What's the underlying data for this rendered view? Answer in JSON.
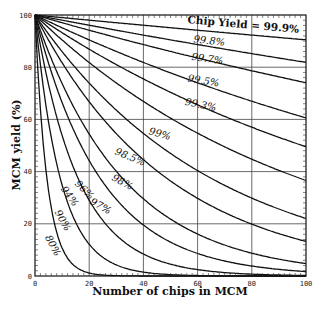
{
  "chart_data": {
    "type": "line",
    "title": "",
    "xlabel": "Number of chips in MCM",
    "ylabel": "MCM yield (%)",
    "xlim": [
      0,
      100
    ],
    "ylim": [
      0,
      100
    ],
    "xticks": [
      "0",
      "20",
      "40",
      "60",
      "80",
      "100"
    ],
    "yticks": [
      "0",
      "20",
      "40",
      "60",
      "80",
      "100"
    ],
    "grid": true,
    "formula": "MCM yield = (chip yield)^n x 100",
    "series": [
      {
        "name": "80%",
        "chip_yield": 0.8
      },
      {
        "name": "90%",
        "chip_yield": 0.9
      },
      {
        "name": "94%",
        "chip_yield": 0.94
      },
      {
        "name": "96%",
        "chip_yield": 0.96
      },
      {
        "name": "97%",
        "chip_yield": 0.97
      },
      {
        "name": "98%",
        "chip_yield": 0.98
      },
      {
        "name": "98.5%",
        "chip_yield": 0.985
      },
      {
        "name": "99%",
        "chip_yield": 0.99
      },
      {
        "name": "99.3%",
        "chip_yield": 0.993
      },
      {
        "name": "99.5%",
        "chip_yield": 0.995
      },
      {
        "name": "99.7%",
        "chip_yield": 0.997
      },
      {
        "name": "99.8%",
        "chip_yield": 0.998
      },
      {
        "name": "Chip Yield = 99.9%",
        "chip_yield": 0.999
      }
    ],
    "sample_values_at_n100": {
      "99.9%": 90.5,
      "99.8%": 81.9,
      "99.7%": 74.1,
      "99.5%": 60.6,
      "99.3%": 49.5,
      "99%": 36.6,
      "98.5%": 22.0,
      "98%": 13.3,
      "97%": 4.8,
      "96%": 1.7
    }
  }
}
